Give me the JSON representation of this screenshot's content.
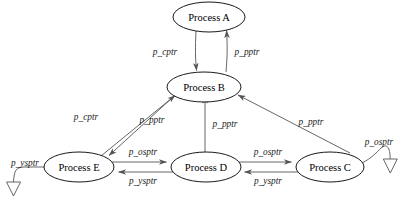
{
  "diagram": {
    "background_color": "#ffffff",
    "line_color": "#555555",
    "text_color": "#000000",
    "nodes": [
      {
        "id": "A",
        "label": "Process A",
        "cx": 209,
        "cy": 17,
        "rx": 36,
        "ry": 15
      },
      {
        "id": "B",
        "label": "Process B",
        "cx": 204,
        "cy": 87,
        "rx": 37,
        "ry": 15
      },
      {
        "id": "E",
        "label": "Process E",
        "cx": 79,
        "cy": 167,
        "rx": 35,
        "ry": 15
      },
      {
        "id": "D",
        "label": "Process D",
        "cx": 206,
        "cy": 167,
        "rx": 35,
        "ry": 15
      },
      {
        "id": "C",
        "label": "Process C",
        "cx": 330,
        "cy": 167,
        "rx": 34,
        "ry": 15
      }
    ],
    "edges": [
      {
        "id": "a-b-down",
        "from": "A",
        "to": "B",
        "label": "p_cptr",
        "label_x": 165,
        "label_y": 52
      },
      {
        "id": "b-a-up",
        "from": "B",
        "to": "A",
        "label": "p_pptr",
        "label_x": 247,
        "label_y": 52
      },
      {
        "id": "b-e-down",
        "from": "B",
        "to": "E",
        "label": "p_cptr",
        "label_x": 86,
        "label_y": 117
      },
      {
        "id": "e-b-up",
        "from": "E",
        "to": "B",
        "label": "p_pptr",
        "label_x": 152,
        "label_y": 120
      },
      {
        "id": "d-b-up",
        "from": "D",
        "to": "B",
        "label": "p_pptr",
        "label_x": 225,
        "label_y": 124
      },
      {
        "id": "c-b-up",
        "from": "C",
        "to": "B",
        "label": "p_pptr",
        "label_x": 311,
        "label_y": 122
      },
      {
        "id": "e-d-right",
        "from": "E",
        "to": "D",
        "label": "p_osptr",
        "label_x": 143,
        "label_y": 152
      },
      {
        "id": "d-e-left",
        "from": "D",
        "to": "E",
        "label": "p_ysptr",
        "label_x": 143,
        "label_y": 181
      },
      {
        "id": "d-c-right",
        "from": "D",
        "to": "C",
        "label": "p_osptr",
        "label_x": 268,
        "label_y": 152
      },
      {
        "id": "c-d-left",
        "from": "C",
        "to": "D",
        "label": "p_ysptr",
        "label_x": 268,
        "label_y": 181
      },
      {
        "id": "e-null",
        "from": "E",
        "to": "null-left",
        "label": "p_ysptr",
        "label_x": 25,
        "label_y": 163
      },
      {
        "id": "c-null",
        "from": "C",
        "to": "null-right",
        "label": "p_osptr",
        "label_x": 379,
        "label_y": 142
      }
    ],
    "caption": ""
  }
}
